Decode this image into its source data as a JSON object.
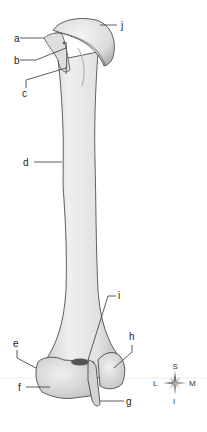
{
  "figure": {
    "labels": {
      "a": "a",
      "b": "b",
      "c": "c",
      "d": "d",
      "e": "e",
      "f": "f",
      "g": "g",
      "h": "h",
      "i": "i",
      "j": "j"
    },
    "compass": {
      "superior": "S",
      "inferior": "I",
      "lateral": "L",
      "medial": "M"
    },
    "colors": {
      "bone_fill": "#e6e6e6",
      "bone_shadow": "#b9b9b9",
      "bone_outline": "#3a3a3a",
      "label_text": "#222222",
      "background": "#ffffff"
    }
  }
}
